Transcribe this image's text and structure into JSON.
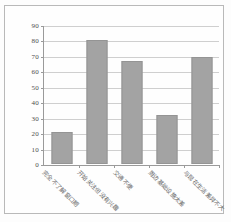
{
  "chart_data": {
    "type": "bar",
    "title": "",
    "xlabel": "",
    "ylabel": "",
    "ylim": [
      0,
      90
    ],
    "ytick_step": 10,
    "yticks": [
      90,
      80,
      70,
      60,
      50,
      40,
      30,
      20,
      10,
      0
    ],
    "grid": true,
    "legend": "none",
    "categories": [
      "完全不了解窗口期",
      "开始关注但没有兴趣",
      "交通不便",
      "周边基础设施太差",
      "与现在生活差异不大"
    ],
    "values": [
      21,
      81,
      67,
      32,
      70
    ],
    "series": [
      {
        "name": "比例",
        "values": [
          21,
          81,
          67,
          32,
          70
        ]
      }
    ]
  },
  "style": {
    "bar_color": "#a3a3a3",
    "bar_border_color": "#949494",
    "gridline_color": "#cfcfcf",
    "axis_color": "#9a9a9a",
    "frame_color": "#b9b9b9",
    "background": "#fefefe",
    "tick_text_color": "#4c4c4c",
    "label_text_color": "#585858"
  }
}
